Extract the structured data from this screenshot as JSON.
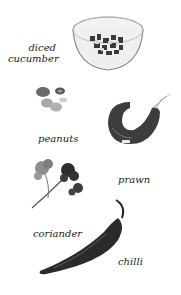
{
  "ingredients": [
    {
      "id": "cucumber",
      "label_line1": "diced",
      "label_line2": "cucumber"
    },
    {
      "id": "peanuts",
      "label": "peanuts"
    },
    {
      "id": "prawn",
      "label": "prawn"
    },
    {
      "id": "coriander",
      "label": "coriander"
    },
    {
      "id": "chilli",
      "label": "chilli"
    }
  ]
}
